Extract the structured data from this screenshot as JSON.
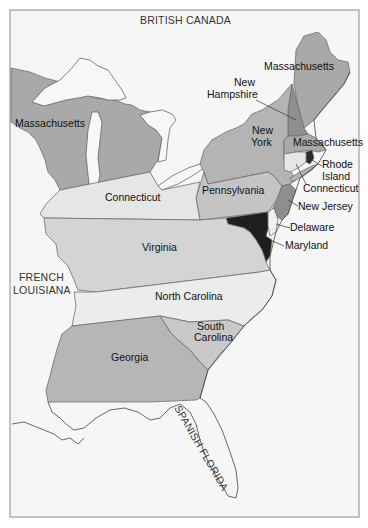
{
  "map": {
    "title": "",
    "foreign_territories": {
      "british_canada": "BRITISH CANADA",
      "french_louisiana_line1": "FRENCH",
      "french_louisiana_line2": "LOUISIANA",
      "spanish_florida": "SPANISH FLORIDA"
    },
    "colonies": {
      "massachusetts_west": "Massachusetts",
      "massachusetts_maine": "Massachusetts",
      "massachusetts_main": "Massachusetts",
      "new_hampshire_line1": "New",
      "new_hampshire_line2": "Hampshire",
      "new_york_line1": "New",
      "new_york_line2": "York",
      "rhode_island_line1": "Rhode",
      "rhode_island_line2": "Island",
      "connecticut_east": "Connecticut",
      "connecticut_west": "Connecticut",
      "pennsylvania": "Pennsylvania",
      "new_jersey": "New Jersey",
      "delaware": "Delaware",
      "maryland": "Maryland",
      "virginia": "Virginia",
      "north_carolina": "North Carolina",
      "south_carolina_line1": "South",
      "south_carolina_line2": "Carolina",
      "georgia": "Georgia"
    },
    "colors": {
      "background": "#f6f6f6",
      "massachusetts": "#a9a9a9",
      "new_hampshire": "#8f8f8f",
      "new_york": "#b4b4b4",
      "connecticut": "#e6e6e6",
      "rhode_island": "#2a2a2a",
      "pennsylvania": "#c4c4c4",
      "new_jersey": "#8e8e8e",
      "maryland": "#1e1e1e",
      "delaware": "#f0f0f0",
      "virginia": "#d4d4d4",
      "north_carolina": "#ececec",
      "south_carolina": "#c9c9c9",
      "georgia": "#b6b6b6"
    }
  }
}
